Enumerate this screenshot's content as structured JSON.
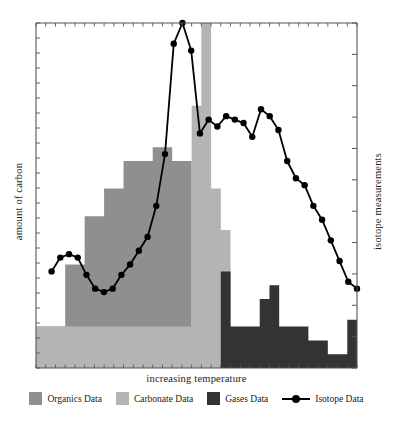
{
  "chart_data": {
    "type": "area",
    "title": "",
    "xlabel": "increasing temperature",
    "ylabel": "amount of carbon",
    "ylabel_right": "isotope measurements",
    "grid": false,
    "legend_position": "bottom",
    "axes": {
      "x_ticks_count": 33,
      "y_left_ticks_count": 23,
      "y_right_ticks_count": 11,
      "x_tick_labels": [],
      "y_tick_labels": []
    },
    "colors": {
      "organics": "#8f8f8f",
      "carbonate": "#b4b4b4",
      "gases": "#333333",
      "isotope": "#000000",
      "axis": "#555555",
      "background": "#ffffff"
    },
    "series": [
      {
        "name": "Organics Data",
        "type": "step-area",
        "color": "#8f8f8f",
        "x": [
          0,
          1,
          2,
          3,
          4,
          5,
          6,
          7,
          8,
          9,
          10,
          11,
          12,
          13,
          14,
          15,
          16,
          17,
          18,
          19,
          20,
          21,
          22,
          23,
          24,
          25,
          26,
          27,
          28,
          29,
          30,
          31,
          32
        ],
        "values": [
          12,
          12,
          12,
          30,
          30,
          44,
          44,
          52,
          52,
          60,
          60,
          60,
          64,
          64,
          60,
          60,
          0,
          0,
          0,
          0,
          0,
          0,
          0,
          0,
          0,
          0,
          0,
          0,
          0,
          0,
          0,
          0,
          0
        ]
      },
      {
        "name": "Carbonate Data",
        "type": "step-area",
        "color": "#b4b4b4",
        "x": [
          0,
          1,
          2,
          3,
          4,
          5,
          6,
          7,
          8,
          9,
          10,
          11,
          12,
          13,
          14,
          15,
          16,
          17,
          18,
          19,
          20,
          21,
          22,
          23,
          24,
          25,
          26,
          27,
          28,
          29,
          30,
          31,
          32
        ],
        "values": [
          12,
          12,
          12,
          12,
          12,
          12,
          12,
          12,
          12,
          12,
          12,
          12,
          12,
          12,
          12,
          12,
          76,
          100,
          52,
          40,
          0,
          0,
          0,
          0,
          0,
          0,
          0,
          0,
          0,
          0,
          0,
          0,
          0
        ]
      },
      {
        "name": "Gases Data",
        "type": "step-area",
        "color": "#333333",
        "x": [
          0,
          1,
          2,
          3,
          4,
          5,
          6,
          7,
          8,
          9,
          10,
          11,
          12,
          13,
          14,
          15,
          16,
          17,
          18,
          19,
          20,
          21,
          22,
          23,
          24,
          25,
          26,
          27,
          28,
          29,
          30,
          31,
          32
        ],
        "values": [
          0,
          0,
          0,
          0,
          0,
          0,
          0,
          0,
          0,
          0,
          0,
          0,
          0,
          0,
          0,
          0,
          0,
          0,
          0,
          28,
          12,
          12,
          12,
          20,
          24,
          12,
          12,
          12,
          8,
          8,
          4,
          4,
          14
        ]
      },
      {
        "name": "Isotope Data",
        "type": "line",
        "color": "#000000",
        "marker": "circle",
        "x": [
          2,
          3,
          4,
          5,
          6,
          7,
          8,
          9,
          10,
          11,
          12,
          13,
          14,
          15,
          16,
          17,
          18,
          19,
          20,
          21,
          22,
          23,
          24,
          25,
          26,
          27,
          28,
          29,
          30,
          31,
          32,
          33,
          34,
          35,
          36,
          37
        ],
        "values": [
          28,
          32,
          33,
          32,
          27,
          23,
          22,
          23,
          27,
          30,
          34,
          38,
          47,
          62,
          94,
          100,
          92,
          68,
          72,
          70,
          73,
          72,
          71,
          67,
          75,
          73,
          69,
          60,
          55,
          53,
          47,
          43,
          37,
          31,
          25,
          23
        ]
      }
    ]
  },
  "labels": {
    "x_axis": "increasing temperature",
    "y_axis_left": "amount of carbon",
    "y_axis_right": "isotope measurements"
  },
  "legend": {
    "items": [
      {
        "label": "Organics Data",
        "color": "#8f8f8f",
        "marker": "square"
      },
      {
        "label": "Carbonate Data",
        "color": "#b4b4b4",
        "marker": "square"
      },
      {
        "label": "Gases Data",
        "color": "#333333",
        "marker": "square"
      },
      {
        "label": "Isotope Data",
        "color": "#000000",
        "marker": "line-circle"
      }
    ]
  }
}
